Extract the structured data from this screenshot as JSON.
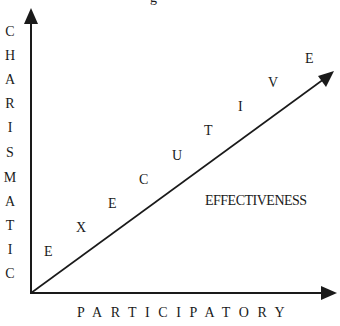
{
  "diagram": {
    "top_fragment": "g",
    "y_axis_label": "CHARISMATIC",
    "y_axis_letters": [
      "C",
      "H",
      "A",
      "R",
      "I",
      "S",
      "M",
      "A",
      "T",
      "I",
      "C"
    ],
    "x_axis_label": "PARTICIPATORY",
    "diagonal_label": "EXECUTIVE",
    "diagonal_letters": [
      "E",
      "X",
      "E",
      "C",
      "U",
      "T",
      "I",
      "V",
      "E"
    ],
    "region_label": "EFFECTIVENESS",
    "line_color": "#1a1a1a"
  }
}
